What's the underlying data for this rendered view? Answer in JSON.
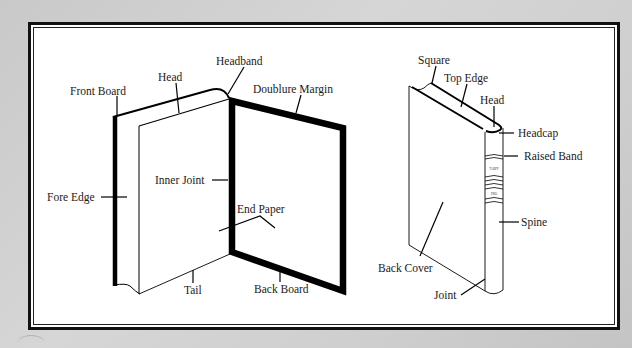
{
  "diagram": {
    "colors": {
      "background": "#cfcfcf",
      "panel": "#ffffff",
      "ink": "#111111"
    },
    "open_book": {
      "labels": {
        "front_board": "Front Board",
        "head": "Head",
        "headband": "Headband",
        "doublure_margin": "Doublure Margin",
        "fore_edge": "Fore Edge",
        "inner_joint": "Inner Joint",
        "end_paper": "End Paper",
        "tail": "Tail",
        "back_board": "Back Board"
      }
    },
    "closed_book": {
      "labels": {
        "square": "Square",
        "top_edge": "Top Edge",
        "head": "Head",
        "headcap": "Headcap",
        "raised_band": "Raised Band",
        "spine": "Spine",
        "back_cover": "Back Cover",
        "joint": "Joint"
      },
      "spine_text": [
        "TARPY",
        "PRO"
      ]
    }
  }
}
